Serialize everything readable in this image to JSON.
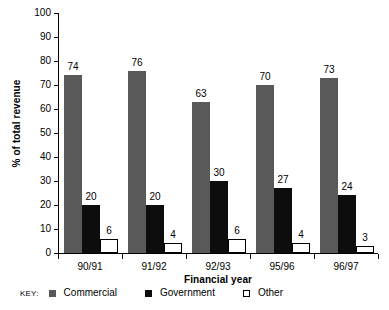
{
  "chart_data": {
    "type": "bar",
    "title": "",
    "xlabel": "Financial year",
    "ylabel": "% of total revenue",
    "categories": [
      "90/91",
      "91/92",
      "92/93",
      "95/96",
      "96/97"
    ],
    "series": [
      {
        "name": "Commercial",
        "color": "#595959",
        "values": [
          74,
          76,
          63,
          70,
          73
        ]
      },
      {
        "name": "Government",
        "color": "#0d0d0d",
        "values": [
          20,
          20,
          30,
          27,
          24
        ]
      },
      {
        "name": "Other",
        "color": "#ffffff",
        "values": [
          6,
          4,
          6,
          4,
          3
        ]
      }
    ],
    "ylim": [
      0,
      100
    ],
    "ytick_labels": [
      "100",
      "90",
      "80",
      "70",
      "60",
      "50",
      "40",
      "30",
      "20",
      "10",
      "0"
    ],
    "ytick_values": [
      100,
      90,
      80,
      70,
      60,
      50,
      40,
      30,
      20,
      10,
      0
    ],
    "grid": false,
    "legend_position": "bottom",
    "legend_caption": "KEY:",
    "data_labels": true
  }
}
